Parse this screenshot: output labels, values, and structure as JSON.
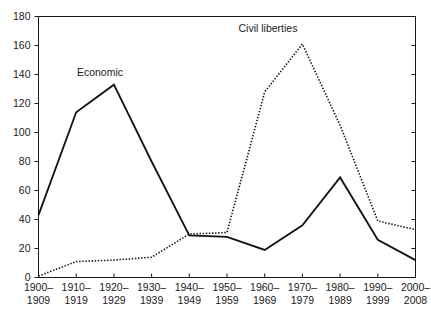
{
  "chart_data": {
    "type": "line",
    "title": "",
    "xlabel": "",
    "ylabel": "",
    "ylim": [
      0,
      180
    ],
    "yticks": [
      0,
      20,
      40,
      60,
      80,
      100,
      120,
      140,
      160,
      180
    ],
    "grid": false,
    "legend_position": "inline-annotations",
    "categories": [
      "1900–\n1909",
      "1910–\n1919",
      "1920–\n1929",
      "1930–\n1939",
      "1940–\n1949",
      "1950–\n1959",
      "1960–\n1969",
      "1970–\n1979",
      "1980–\n1989",
      "1990–\n1999",
      "2000–\n2008"
    ],
    "category_lines": [
      [
        "1900–",
        "1909"
      ],
      [
        "1910–",
        "1919"
      ],
      [
        "1920–",
        "1929"
      ],
      [
        "1930–",
        "1939"
      ],
      [
        "1940–",
        "1949"
      ],
      [
        "1950–",
        "1959"
      ],
      [
        "1960–",
        "1969"
      ],
      [
        "1970–",
        "1979"
      ],
      [
        "1980–",
        "1989"
      ],
      [
        "1990–",
        "1999"
      ],
      [
        "2000–",
        "2008"
      ]
    ],
    "series": [
      {
        "name": "Economic",
        "style": "solid",
        "values": [
          43,
          114,
          133,
          80,
          29,
          28,
          19,
          36,
          69,
          26,
          12
        ]
      },
      {
        "name": "Civil liberties",
        "style": "dotted",
        "values": [
          1,
          11,
          12,
          14,
          30,
          31,
          128,
          161,
          105,
          39,
          33
        ]
      }
    ],
    "annotations": [
      {
        "text": "Economic",
        "series": "Economic",
        "x_px": 100,
        "y_px": 76
      },
      {
        "text": "Civil liberties",
        "series": "Civil liberties",
        "x_px": 268,
        "y_px": 32
      }
    ]
  }
}
